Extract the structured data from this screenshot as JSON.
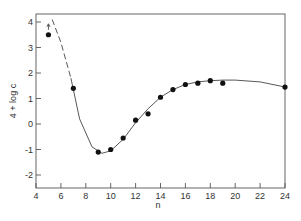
{
  "chart_data": {
    "type": "scatter",
    "title": "",
    "xlabel": "n",
    "ylabel": "4 + log c",
    "xlim": [
      4,
      24
    ],
    "ylim": [
      -2.5,
      4.3
    ],
    "x_ticks": [
      4,
      6,
      8,
      10,
      12,
      14,
      16,
      18,
      20,
      22,
      24
    ],
    "y_ticks": [
      -2,
      -1,
      0,
      1,
      2,
      3,
      4
    ],
    "grid": false,
    "legend": null,
    "series": [
      {
        "name": "data points",
        "style": "filled circles",
        "x": [
          5,
          7,
          9,
          10,
          11,
          12,
          13,
          14,
          15,
          16,
          17,
          18,
          19,
          24
        ],
        "y": [
          3.5,
          1.4,
          -1.1,
          -1.0,
          -0.55,
          0.15,
          0.4,
          1.05,
          1.35,
          1.55,
          1.6,
          1.7,
          1.6,
          1.45
        ]
      },
      {
        "name": "fitted curve (dashed extrapolation)",
        "style": "dashed line",
        "x": [
          5.3,
          6,
          6.8
        ],
        "y": [
          4.1,
          3.2,
          1.8
        ]
      },
      {
        "name": "fitted curve",
        "style": "solid line",
        "x": [
          6.8,
          7.5,
          8.5,
          9.3,
          10,
          11,
          12,
          13,
          14,
          15,
          16,
          17,
          18,
          19,
          20,
          22,
          24
        ],
        "y": [
          1.8,
          0.2,
          -0.9,
          -1.15,
          -1.05,
          -0.6,
          0.05,
          0.6,
          1.05,
          1.35,
          1.55,
          1.65,
          1.7,
          1.72,
          1.72,
          1.65,
          1.45
        ]
      }
    ],
    "annotations": [
      "upward arrow above point at n=5"
    ]
  }
}
